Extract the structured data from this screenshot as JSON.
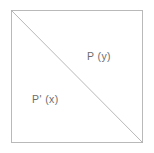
{
  "figure": {
    "canvas": {
      "width": 154,
      "height": 153,
      "background_color": "#ffffff"
    },
    "square": {
      "name": "bounding-square",
      "border_color": "#b9b9b9",
      "border_width": 1,
      "left": 11,
      "top": 10,
      "width": 132,
      "height": 133,
      "fill": "none"
    },
    "diagonal": {
      "name": "anti-diagonal-divider",
      "description": "line from top-left corner to bottom-right corner",
      "color": "#b0b0b0",
      "width": 0.9,
      "x1": 0,
      "y1": 0,
      "x2": 132,
      "y2": 133
    },
    "labels": [
      {
        "id": "upper-right",
        "text": "P (y)",
        "color": "#6d6d6d",
        "x": 87,
        "y": 50
      },
      {
        "id": "lower-left",
        "text": "P' (x)",
        "color": "#6d6d6d",
        "x": 32,
        "y": 93
      }
    ]
  }
}
